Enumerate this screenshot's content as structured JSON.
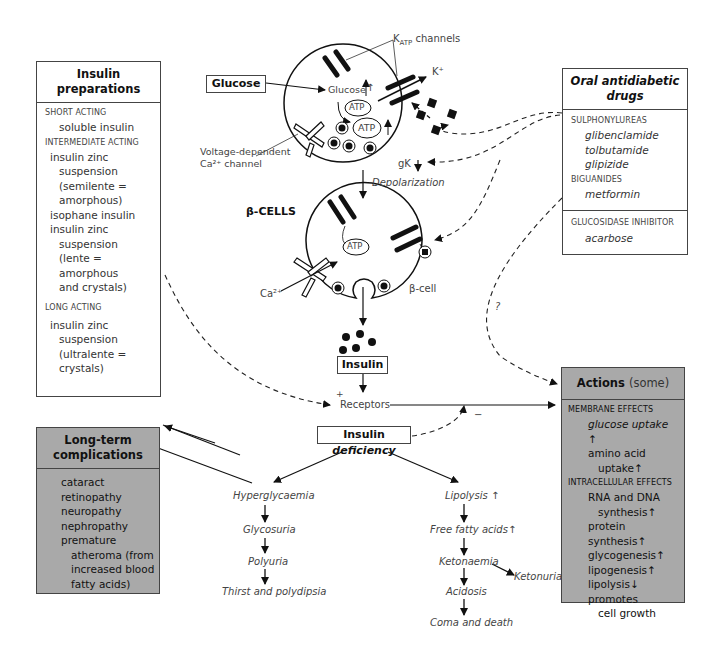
{
  "diagram": {
    "top_labels": {
      "katp_channels": "K",
      "katp_sub": "ATP",
      "katp_suffix": " channels",
      "k_plus": "K⁺",
      "glucose_box": "Glucose",
      "glucose_inner": "Glucose",
      "atp_small": "ATP",
      "atp_large": "ATP",
      "vd_channel_line1": "Voltage-dependent",
      "vd_channel_line2": "Ca²⁺ channel",
      "gk": "gK",
      "depolarization": "Depolarization",
      "beta_cells": "β-CELLS",
      "atp_cell2": "ATP",
      "ca2": "Ca²⁺",
      "beta_cell": "β-cell",
      "insulin_box": "Insulin",
      "plus": "+",
      "minus": "−",
      "receptors": "Receptors",
      "question": "?",
      "insulin_deficiency_a": "Insulin ",
      "insulin_deficiency_b": "deficiency"
    },
    "insulin_preparations": {
      "title": "Insulin preparations",
      "sections": [
        {
          "category": "SHORT ACTING",
          "items": [
            "soluble insulin"
          ]
        },
        {
          "category": "INTERMEDIATE ACTING",
          "items": [
            "insulin zinc",
            "suspension",
            "(semilente =",
            "amorphous)",
            "isophane insulin",
            "insulin zinc",
            "suspension",
            "(lente =",
            "amorphous",
            "and crystals)"
          ]
        },
        {
          "category": "LONG ACTING",
          "items": [
            "insulin zinc",
            "suspension",
            "(ultralente =",
            "crystals)"
          ]
        }
      ]
    },
    "oral_antidiabetic": {
      "title": "Oral antidiabetic drugs",
      "sections": [
        {
          "category": "SULPHONYLUREAS",
          "items": [
            "glibenclamide",
            "tolbutamide",
            "glipizide"
          ]
        },
        {
          "category": "BIGUANIDES",
          "items": [
            "metformin"
          ]
        },
        {
          "category": "GLUCOSIDASE INHIBITOR",
          "items": [
            "acarbose"
          ]
        }
      ]
    },
    "actions": {
      "title": "Actions",
      "title_suffix": "(some)",
      "sections": [
        {
          "category": "MEMBRANE EFFECTS",
          "items": [
            "glucose uptake ↑",
            "amino acid",
            "uptake↑"
          ]
        },
        {
          "category": "INTRACELLULAR EFFECTS",
          "items": [
            "RNA and DNA",
            "synthesis↑",
            "protein synthesis↑",
            "glycogenesis↑",
            "lipogenesis↑",
            "lipolysis↓",
            "promotes",
            "cell growth"
          ]
        }
      ]
    },
    "complications": {
      "title": "Long-term complications",
      "items": [
        "cataract",
        "retinopathy",
        "neuropathy",
        "nephropathy",
        "premature",
        "atheroma (from",
        "increased blood",
        "fatty acids)"
      ]
    },
    "hyperglycaemia_chain": [
      "Hyperglycaemia",
      "Glycosuria",
      "Polyuria",
      "Thirst and polydipsia"
    ],
    "lipolysis_chain": [
      "Lipolysis ↑",
      "Free fatty acids↑",
      "Ketonaemia",
      "Acidosis",
      "Coma and death"
    ],
    "ketonuria": "Ketonuria",
    "colors": {
      "shaded_box": "#a9a9a9",
      "line": "#111111",
      "text": "#444444"
    }
  }
}
